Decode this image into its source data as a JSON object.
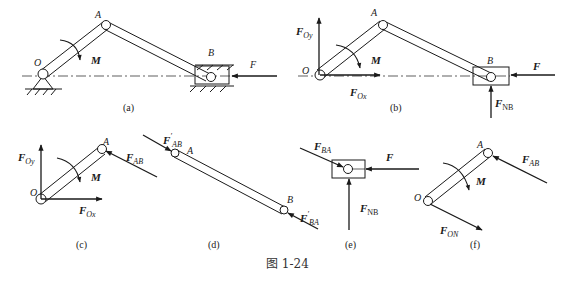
{
  "figure": {
    "caption": "图 1-24",
    "subfigures": [
      {
        "id": "a",
        "label": "(a)",
        "points": [
          "O",
          "A",
          "B"
        ],
        "moment": "M",
        "forces": [
          {
            "name": "F",
            "direction": "left"
          }
        ],
        "description": "Crank-slider mechanism with fixed pin at O and slider B in guide"
      },
      {
        "id": "b",
        "label": "(b)",
        "points": [
          "O",
          "A",
          "B"
        ],
        "moment": "M",
        "forces": [
          {
            "name": "F_Oy",
            "direction": "up"
          },
          {
            "name": "F_Ox",
            "direction": "right"
          },
          {
            "name": "F",
            "direction": "left"
          },
          {
            "name": "F_NB",
            "direction": "up"
          }
        ]
      },
      {
        "id": "c",
        "label": "(c)",
        "points": [
          "O",
          "A"
        ],
        "moment": "M",
        "forces": [
          {
            "name": "F_Oy",
            "direction": "up"
          },
          {
            "name": "F_Ox",
            "direction": "right"
          },
          {
            "name": "F_AB",
            "direction": "toward A"
          }
        ]
      },
      {
        "id": "d",
        "label": "(d)",
        "points": [
          "A",
          "B"
        ],
        "forces": [
          {
            "name": "F'_AB",
            "direction": "toward A"
          },
          {
            "name": "F'_BA",
            "direction": "toward B"
          }
        ]
      },
      {
        "id": "e",
        "label": "(e)",
        "points": [],
        "forces": [
          {
            "name": "F_BA",
            "direction": "toward slider"
          },
          {
            "name": "F",
            "direction": "left"
          },
          {
            "name": "F_NB",
            "direction": "up"
          }
        ]
      },
      {
        "id": "f",
        "label": "(f)",
        "points": [
          "O",
          "A"
        ],
        "moment": "M",
        "forces": [
          {
            "name": "F_AB",
            "direction": "toward A"
          },
          {
            "name": "F_ON",
            "direction": "down-right"
          }
        ]
      }
    ]
  },
  "labels": {
    "O": "O",
    "A": "A",
    "B": "B",
    "M": "M",
    "F": "F",
    "Fmain": "F",
    "Oy": "Oy",
    "Ox": "Ox",
    "AB": "AB",
    "BA": "BA",
    "NB": "NB",
    "ON": "ON",
    "prime": "′",
    "cap_a": "(a)",
    "cap_b": "(b)",
    "cap_c": "(c)",
    "cap_d": "(d)",
    "cap_e": "(e)",
    "cap_f": "(f)"
  },
  "colors": {
    "ink": "#1a1a1a",
    "background": "#ffffff"
  }
}
